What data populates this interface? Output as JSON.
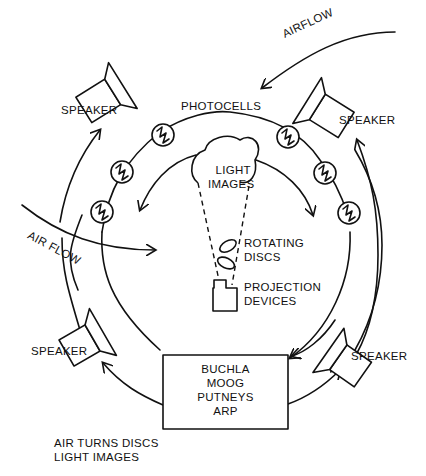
{
  "diagram": {
    "type": "light-sound installation schematic",
    "labels": {
      "airflow_top": "AIRFLOW",
      "air_flow_left": "AIR FLOW",
      "photocells": "PHOTOCELLS",
      "speaker_top_left": "SPEAKER",
      "speaker_top_right": "SPEAKER",
      "speaker_bottom_left": "SPEAKER",
      "speaker_bottom_right": "SPEAKER",
      "light_images": [
        "LIGHT",
        "IMAGES"
      ],
      "rotating_discs": [
        "ROTATING",
        "DISCS"
      ],
      "projection_devices": [
        "PROJECTION",
        "DEVICES"
      ],
      "synth_box": [
        "BUCHLA",
        "MOOG",
        "PUTNEYS",
        "ARP"
      ],
      "caption": [
        "AIR TURNS DISCS",
        "LIGHT IMAGES"
      ]
    },
    "nodes": [
      {
        "id": "photocell",
        "count": 6
      },
      {
        "id": "speaker",
        "count": 4
      },
      {
        "id": "synthesizer-box",
        "items": [
          "BUCHLA",
          "MOOG",
          "PUTNEYS",
          "ARP"
        ]
      },
      {
        "id": "projection-device"
      },
      {
        "id": "rotating-disc",
        "count": 2
      },
      {
        "id": "light-images-cloud"
      }
    ],
    "colors": {
      "ink": "#111111",
      "background": "#ffffff"
    }
  }
}
